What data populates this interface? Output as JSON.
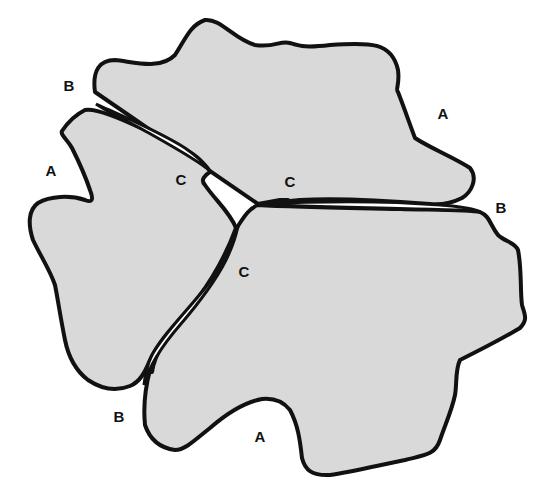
{
  "figure": {
    "fill_color": "#d9d9d9",
    "stroke_color": "#111111",
    "background_color": "#ffffff"
  },
  "regions": [
    {
      "id": "upper-lobe",
      "name": "Upper lobe"
    },
    {
      "id": "right-lobe",
      "name": "Right lobe"
    },
    {
      "id": "left-lobe",
      "name": "Left lobe"
    }
  ],
  "labels": [
    {
      "id": "label-b-upper-left",
      "text": "B",
      "meaning": "cleft opening"
    },
    {
      "id": "label-a-upper-right",
      "text": "A",
      "meaning": "lobe margin"
    },
    {
      "id": "label-a-left",
      "text": "A",
      "meaning": "lobe margin"
    },
    {
      "id": "label-c-left",
      "text": "C",
      "meaning": "cleft tip"
    },
    {
      "id": "label-c-right",
      "text": "C",
      "meaning": "cleft tip"
    },
    {
      "id": "label-b-right",
      "text": "B",
      "meaning": "cleft opening"
    },
    {
      "id": "label-c-lower",
      "text": "C",
      "meaning": "cleft tip"
    },
    {
      "id": "label-b-lower",
      "text": "B",
      "meaning": "cleft opening"
    },
    {
      "id": "label-a-lower",
      "text": "A",
      "meaning": "lobe margin"
    }
  ]
}
